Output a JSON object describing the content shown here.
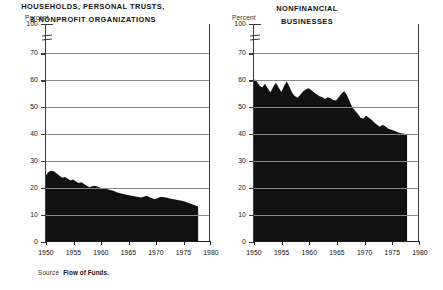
{
  "figure": {
    "source_label": "Source",
    "source_value": "Flow of Funds."
  },
  "panels": [
    {
      "key": "households",
      "unit_label": "Percent",
      "title_line1": "HOUSEHOLDS, PERSONAL TRUSTS,",
      "title_line2": "& NONPROFIT ORGANIZATIONS",
      "yticks": [
        "100",
        "70",
        "60",
        "50",
        "40",
        "30",
        "20",
        "10",
        "0"
      ],
      "xticks": [
        "1950",
        "1955",
        "1960",
        "1965",
        "1970",
        "1975",
        "1980"
      ]
    },
    {
      "key": "nonfinancial",
      "unit_label": "Percent",
      "title_line1": "NONFINANCIAL",
      "title_line2": "BUSINESSES",
      "yticks": [
        "100",
        "70",
        "60",
        "50",
        "40",
        "30",
        "20",
        "10",
        "0"
      ],
      "xticks": [
        "1950",
        "1955",
        "1960",
        "1965",
        "1970",
        "1975",
        "1980"
      ]
    }
  ],
  "chart_data": [
    {
      "type": "area",
      "title": "HOUSEHOLDS, PERSONAL TRUSTS, & NONPROFIT ORGANIZATIONS",
      "xlabel": "",
      "ylabel": "Percent",
      "ylim": [
        0,
        100
      ],
      "xlim": [
        1950,
        1980
      ],
      "y_axis_break_between": [
        70,
        100
      ],
      "yticks": [
        0,
        10,
        20,
        30,
        40,
        50,
        60,
        70,
        100
      ],
      "xticks": [
        1950,
        1955,
        1960,
        1965,
        1970,
        1975,
        1980
      ],
      "grid": "horizontal",
      "fill_color": "#111111",
      "series_name": "Share of total",
      "x": [
        1950,
        1950.5,
        1951,
        1951.5,
        1952,
        1952.5,
        1953,
        1953.5,
        1954,
        1954.5,
        1955,
        1955.5,
        1956,
        1956.5,
        1957,
        1957.5,
        1958,
        1958.5,
        1959,
        1959.5,
        1960,
        1960.5,
        1961,
        1961.5,
        1962,
        1962.5,
        1963,
        1963.5,
        1964,
        1964.5,
        1965,
        1965.5,
        1966,
        1966.5,
        1967,
        1967.5,
        1968,
        1968.5,
        1969,
        1969.5,
        1970,
        1970.5,
        1971,
        1971.5,
        1972,
        1972.5,
        1973,
        1973.5,
        1974,
        1974.5,
        1975,
        1975.5,
        1976,
        1976.5,
        1977,
        1977.5,
        1978
      ],
      "values": [
        24.5,
        25.8,
        26.2,
        25.9,
        25.2,
        24.3,
        23.6,
        23.9,
        23.2,
        22.6,
        22.9,
        22.2,
        21.6,
        21.9,
        21.3,
        20.6,
        20.0,
        20.4,
        20.6,
        20.2,
        19.9,
        19.6,
        19.5,
        19.2,
        18.9,
        18.6,
        18.2,
        17.9,
        17.6,
        17.4,
        17.2,
        17.0,
        16.8,
        16.6,
        16.4,
        16.2,
        16.5,
        16.9,
        16.4,
        15.9,
        15.6,
        15.9,
        16.4,
        16.4,
        16.2,
        16.0,
        15.8,
        15.6,
        15.4,
        15.2,
        15.0,
        14.7,
        14.4,
        14.0,
        13.6,
        13.2,
        12.9
      ]
    },
    {
      "type": "area",
      "title": "NONFINANCIAL BUSINESSES",
      "xlabel": "",
      "ylabel": "Percent",
      "ylim": [
        0,
        100
      ],
      "xlim": [
        1950,
        1980
      ],
      "y_axis_break_between": [
        70,
        100
      ],
      "yticks": [
        0,
        10,
        20,
        30,
        40,
        50,
        60,
        70,
        100
      ],
      "xticks": [
        1950,
        1955,
        1960,
        1965,
        1970,
        1975,
        1980
      ],
      "grid": "horizontal",
      "fill_color": "#111111",
      "series_name": "Share of total",
      "x": [
        1950,
        1950.5,
        1951,
        1951.5,
        1952,
        1952.5,
        1953,
        1953.5,
        1954,
        1954.5,
        1955,
        1955.5,
        1956,
        1956.5,
        1957,
        1957.5,
        1958,
        1958.5,
        1959,
        1959.5,
        1960,
        1960.5,
        1961,
        1961.5,
        1962,
        1962.5,
        1963,
        1963.5,
        1964,
        1964.5,
        1965,
        1965.5,
        1966,
        1966.5,
        1967,
        1967.5,
        1968,
        1968.5,
        1969,
        1969.5,
        1970,
        1970.5,
        1971,
        1971.5,
        1972,
        1972.5,
        1973,
        1973.5,
        1974,
        1974.5,
        1975,
        1975.5,
        1976,
        1976.5,
        1977,
        1977.5,
        1978
      ],
      "values": [
        60.3,
        59.5,
        58.0,
        57.2,
        58.6,
        57.0,
        55.4,
        57.4,
        59.0,
        57.2,
        55.6,
        57.8,
        59.6,
        57.4,
        55.2,
        54.0,
        53.4,
        54.6,
        55.8,
        56.6,
        57.0,
        56.2,
        55.4,
        54.6,
        54.0,
        53.6,
        53.0,
        53.6,
        53.2,
        52.6,
        52.4,
        53.6,
        55.0,
        55.8,
        54.4,
        52.0,
        49.8,
        48.6,
        47.4,
        46.0,
        45.6,
        46.8,
        46.0,
        45.2,
        44.2,
        43.4,
        42.6,
        43.4,
        42.8,
        42.0,
        41.6,
        41.2,
        40.8,
        40.4,
        40.2,
        40.0,
        39.6
      ]
    }
  ]
}
